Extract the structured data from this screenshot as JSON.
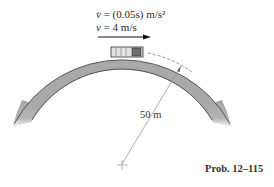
{
  "figure": {
    "accel_label_lhs": "v̇",
    "accel_label_rhs": " = (0.05s) m/s²",
    "accel_var": "s",
    "speed_label_lhs": "v",
    "speed_label_rhs": " = 4 m/s",
    "radius_label": "50 m",
    "caption": "Prob. 12–115",
    "colors": {
      "road": "#a8a8a8",
      "road_edge": "#555555",
      "car_body": "#d8d8d8",
      "car_cab": "#6a6a6a",
      "arrow": "#111111",
      "radius_line": "#8a8a8a"
    }
  }
}
